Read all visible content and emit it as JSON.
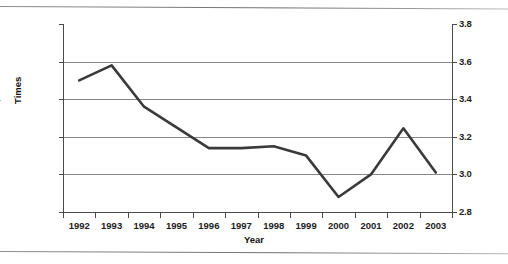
{
  "chart_data": {
    "type": "line",
    "title": "",
    "xlabel": "Year",
    "ylabel": "Times",
    "categories": [
      "1992",
      "1993",
      "1994",
      "1995",
      "1996",
      "1997",
      "1998",
      "1999",
      "2000",
      "2001",
      "2002",
      "2003"
    ],
    "x": [
      1992,
      1993,
      1994,
      1995,
      1996,
      1997,
      1998,
      1999,
      2000,
      2001,
      2002,
      2003
    ],
    "values": [
      3.5,
      3.58,
      3.36,
      3.25,
      3.14,
      3.14,
      3.15,
      3.1,
      2.88,
      3.0,
      3.245,
      3.01
    ],
    "series": [
      {
        "name": "Times",
        "values": [
          3.5,
          3.58,
          3.36,
          3.25,
          3.14,
          3.14,
          3.15,
          3.1,
          2.88,
          3.0,
          3.245,
          3.01
        ],
        "color": "#3a3a3a"
      }
    ],
    "ylim": [
      2.8,
      3.8
    ],
    "yticks": [
      2.8,
      3.0,
      3.2,
      3.4,
      3.6,
      3.8
    ],
    "ytick_labels": [
      "2.8",
      "3.0",
      "3.2",
      "3.4",
      "3.6",
      "3.8"
    ],
    "right_axis_labels": [
      "2.8",
      "3.0",
      "3.2",
      "3.4",
      "3.6",
      "3.8"
    ],
    "grid": true,
    "gridline_values": [
      3.0,
      3.2,
      3.4,
      3.6
    ],
    "legend": "none",
    "legend_position": "none",
    "markers": false,
    "line_width": 2.6,
    "annotations": []
  },
  "axes": {
    "y_title": "Times",
    "x_title": "Year"
  },
  "colors": {
    "line": "#3a3a3a",
    "grid": "#888888",
    "axis": "#4a4a4a",
    "text": "#1d1d1d",
    "background": "#ffffff",
    "page_rule": "#7a7a7a"
  }
}
